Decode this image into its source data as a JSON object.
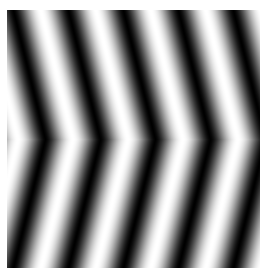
{
  "image": {
    "description": "Grayscale sinusoidal chevron grating; stripes bend with apex pointing right at vertical center",
    "background": "#ffffff",
    "bounds": {
      "x": 7,
      "y": 10,
      "width": 253,
      "height": 258
    },
    "pattern": {
      "type": "chevron-sine-grating",
      "period_px": 55,
      "phase_dark_at_center_x": 38,
      "apex_y_frac": 0.5,
      "edge_shift_px": 32,
      "dark_color": "#000000",
      "light_color": "#ffffff",
      "contrast": 1.0
    }
  }
}
